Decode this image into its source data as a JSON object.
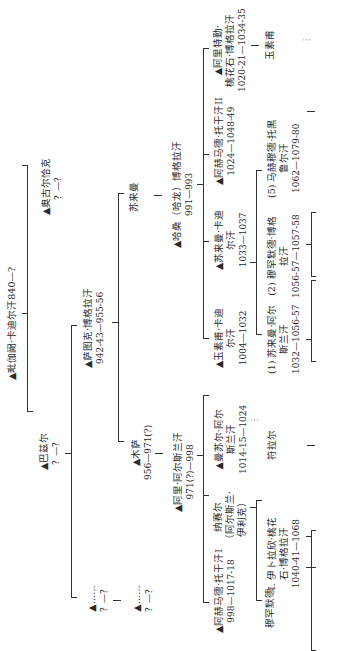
{
  "diagram": {
    "type": "genealogy-tree",
    "orientation": "rotated-90-ccw",
    "marker": "▲",
    "nodes": {
      "root": {
        "name": "▲毗伽阙·卡迪尔汗840—?",
        "dates": ""
      },
      "ogulchak": {
        "name": "▲奥古尔恰克",
        "dates": "？—？"
      },
      "bazir": {
        "name": "▲巴兹尔",
        "dates": "？—？"
      },
      "satuq": {
        "name": "▲萨图克·博格拉汗",
        "dates": "942-43—955-56"
      },
      "unk1": {
        "name": "▲……",
        "dates": "？—？"
      },
      "unk2": {
        "name": "▲……",
        "dates": "？—？"
      },
      "suleiman1": {
        "name": "苏来曼",
        "dates": ""
      },
      "musa": {
        "name": "▲木萨",
        "dates": "956—971(?)"
      },
      "harun": {
        "name": "▲哈桑（哈龙）博格拉汗",
        "dates": "991—993"
      },
      "ali": {
        "name": "▲阿里·阿尔斯兰汗",
        "dates": "971(?)—998"
      },
      "yusuf_qadir": {
        "name": "▲玉素甫·卡迪尔汗",
        "dates": "1004—1032"
      },
      "suleiman_qadir": {
        "name": "▲苏来曼·卡迪尔汗",
        "dates": "1033—1037"
      },
      "ahmad_toghan2": {
        "name": "▲阿赫马德·托干汗II",
        "dates": "1024—1048-49"
      },
      "ali_tegin": {
        "name": "▲阿里特勤·桃花石·博格拉汗",
        "dates": "1020-21—1034-35"
      },
      "yusuf2": {
        "name": "玉素甫",
        "dates": ""
      },
      "mansur": {
        "name": "▲曼苏尔·阿尔斯兰汗",
        "dates": "1014-15—1024"
      },
      "nasr": {
        "name": "纳赛尔（阿尔斯兰·伊利克）",
        "dates": ""
      },
      "ahmad_toghan1": {
        "name": "▲阿赫马德·托干汗I",
        "dates": "998—1017-18"
      },
      "suleiman_arslan": {
        "name": "(1) 苏来曼·阿尔斯兰汗",
        "dates": "1032—1056-57"
      },
      "muhammad_bughra": {
        "name": "(2) 穆罕默德·博格拉汗",
        "dates": "1056-57—1057-58"
      },
      "mahmud_toghril": {
        "name": "(5) 马赫穆德·托黑鲁尔汗",
        "dates": "1062—1079-80"
      },
      "tughril": {
        "name": "符拉尔",
        "dates": ""
      },
      "ibrahim": {
        "name": "I. 伊卜拉欣·桃花石·博格拉汗",
        "dates": "1040-41—1068"
      },
      "muhammad": {
        "name": "穆罕默德",
        "dates": ""
      }
    },
    "labels": {
      "root": [
        "▲毗伽阙·卡迪尔汗840—?"
      ],
      "ogulchak": [
        "▲奥古尔恰克",
        "？—？"
      ],
      "bazir": [
        "▲巴兹尔",
        "？—？"
      ],
      "satuq": [
        "▲萨图克·博格拉汗",
        "942-43—955-56"
      ],
      "unk1": [
        "▲……",
        "？—？"
      ],
      "unk2": [
        "▲……",
        "？—？"
      ],
      "suleiman1": [
        "苏来曼"
      ],
      "musa": [
        "▲木萨",
        "956—971(?)"
      ],
      "harun": [
        "▲哈桑（哈龙）博格拉汗",
        "991—993"
      ],
      "ali": [
        "▲阿里·阿尔斯兰汗",
        "971(?)—998"
      ],
      "yusuf_qadir": [
        "▲玉素甫·卡迪",
        "尔汗",
        "1004—1032"
      ],
      "suleiman_qadir": [
        "▲苏来曼·卡迪",
        "尔汗",
        "1033—1037"
      ],
      "ahmad_toghan2": [
        "▲阿赫马德·托干汗II",
        "1024—1048-49"
      ],
      "ali_tegin": [
        "▲阿里特勤·",
        "桃花石·博格拉汗",
        "1020-21—1034-35"
      ],
      "yusuf2": [
        "玉素甫"
      ],
      "mansur": [
        "▲曼苏尔·阿尔",
        "斯兰汗",
        "1014-15—1024"
      ],
      "nasr": [
        "纳赛尔",
        "（阿尔斯兰·",
        "伊利克）"
      ],
      "ahmad_toghan1": [
        "▲阿赫马德·托干汗I",
        "998—1017-18"
      ],
      "suleiman_arslan": [
        "(1) 苏来曼·阿尔",
        "斯兰汗",
        "1032—1056-57"
      ],
      "muhammad_bughra": [
        "(2) 穆罕默德·博格",
        "拉汗",
        "1056-57—1057-58"
      ],
      "mahmud_toghril": [
        "(5) 马赫穆德·托黑",
        "鲁尔汗",
        "1062—1079-80"
      ],
      "tughril": [
        "符拉尔"
      ],
      "ibrahim": [
        "I. 伊卜拉欣·桃花",
        "石·博格拉汗",
        "1040-41—1068"
      ],
      "muhammad": [
        "穆罕默德"
      ]
    },
    "ellipsis": "⋮"
  }
}
